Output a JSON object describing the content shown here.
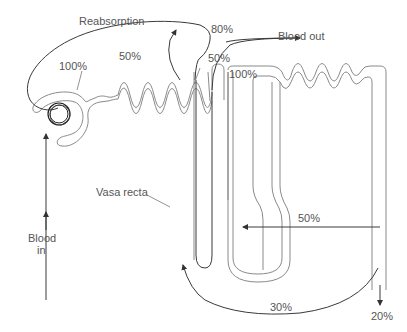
{
  "diagram": {
    "labels": {
      "reabsorption": "Reabsorption",
      "blood_out": "Blood out",
      "blood_in_line1": "Blood",
      "blood_in_line2": "in",
      "vasa_recta": "Vasa recta",
      "pct_glomerulus": "100%",
      "pct_reabsorption": "50%",
      "pct_blood_out": "80%",
      "pct_loop_top": "50%",
      "pct_distal": "100%",
      "pct_collecting": "50%",
      "pct_bottom": "30%",
      "pct_excreted": "20%"
    },
    "colors": {
      "tubule": "#8a8a8a",
      "vessel": "#3a3a3a",
      "text": "#555555"
    }
  }
}
